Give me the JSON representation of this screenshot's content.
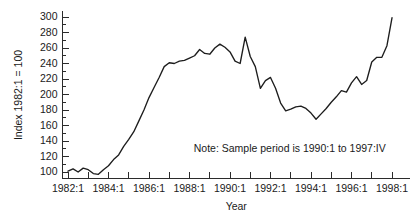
{
  "chart_data": {
    "type": "line",
    "title": "",
    "xlabel": "Year",
    "ylabel": "Index 1982:1 = 100",
    "ylim": [
      90,
      305
    ],
    "xlim": [
      "1982:1",
      "1998:1"
    ],
    "grid": false,
    "legend": null,
    "ytick_labels": [
      "100",
      "120",
      "140",
      "160",
      "180",
      "200",
      "220",
      "240",
      "260",
      "280",
      "300"
    ],
    "ytick_values": [
      100,
      120,
      140,
      160,
      180,
      200,
      220,
      240,
      260,
      280,
      300
    ],
    "ytick_minor_step": 10,
    "xtick_labels": [
      "1982:1",
      "1984:1",
      "1986:1",
      "1988:1",
      "1990:1",
      "1992:1",
      "1994:1",
      "1996:1",
      "1998:1"
    ],
    "xtick_values": [
      1982.0,
      1984.0,
      1986.0,
      1988.0,
      1990.0,
      1992.0,
      1994.0,
      1996.0,
      1998.0
    ],
    "xtick_minor_step": 1,
    "annotations": [
      {
        "name": "sample-period-note",
        "text": "Note: Sample period is 1990:1 to 1997:IV",
        "x": 1993.05,
        "y": 130
      }
    ],
    "series": [
      {
        "name": "index",
        "color": "#1d1d1d",
        "x": [
          1982.0,
          1982.25,
          1982.5,
          1982.75,
          1983.0,
          1983.25,
          1983.5,
          1983.75,
          1984.0,
          1984.25,
          1984.5,
          1984.75,
          1985.0,
          1985.25,
          1985.5,
          1985.75,
          1986.0,
          1986.25,
          1986.5,
          1986.75,
          1987.0,
          1987.25,
          1987.5,
          1987.75,
          1988.0,
          1988.25,
          1988.5,
          1988.75,
          1989.0,
          1989.25,
          1989.5,
          1989.75,
          1990.0,
          1990.25,
          1990.5,
          1990.75,
          1991.0,
          1991.25,
          1991.5,
          1991.75,
          1992.0,
          1992.25,
          1992.5,
          1992.75,
          1993.0,
          1993.25,
          1993.5,
          1993.75,
          1994.0,
          1994.25,
          1994.5,
          1994.75,
          1995.0,
          1995.25,
          1995.5,
          1995.75,
          1996.0,
          1996.25,
          1996.5,
          1996.75,
          1997.0,
          1997.25,
          1997.5,
          1997.75,
          1998.0
        ],
        "values": [
          101,
          104,
          100,
          105,
          103,
          98,
          97,
          103,
          108,
          116,
          122,
          133,
          142,
          152,
          166,
          180,
          196,
          209,
          222,
          236,
          241,
          240,
          243,
          244,
          247,
          250,
          258,
          253,
          252,
          260,
          265,
          261,
          255,
          243,
          240,
          274,
          249,
          236,
          208,
          218,
          222,
          208,
          189,
          179,
          181,
          184,
          185,
          182,
          176,
          168,
          175,
          182,
          190,
          197,
          205,
          203,
          215,
          223,
          213,
          218,
          225,
          232,
          212,
          222,
          233
        ]
      }
    ],
    "series_tail": {
      "x": [
        1997.0,
        1997.25,
        1997.5,
        1997.75,
        1998.0
      ],
      "values": [
        242,
        248,
        248,
        263,
        299
      ]
    }
  },
  "labels": {
    "y_axis_title": "Index 1982:1 = 100",
    "x_axis_title": "Year",
    "note": "Note: Sample period is 1990:1 to 1997:IV"
  }
}
